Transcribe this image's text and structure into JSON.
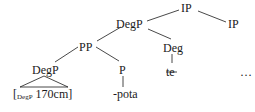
{
  "tree": {
    "nodes": {
      "ip_top": "IP",
      "ip_right": "IP",
      "degp_mid": "DegP",
      "pp": "PP",
      "deg": "Deg",
      "degp_low": "DegP",
      "p": "P",
      "te": "te",
      "bracket_open": "[",
      "bracket_sub": "DegP",
      "bracket_value": " 170cm]",
      "pota": "-pota",
      "ellipsis": "…"
    },
    "te_struck": true
  }
}
